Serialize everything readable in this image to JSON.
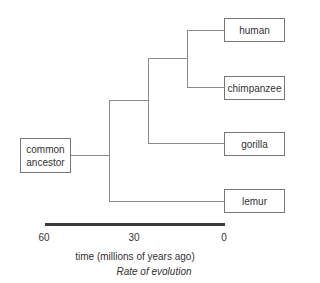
{
  "diagram": {
    "type": "phylogenetic-tree",
    "root": {
      "label_line1": "common",
      "label_line2": "ancestor"
    },
    "leaves": [
      {
        "label": "human"
      },
      {
        "label": "chimpanzee"
      },
      {
        "label": "gorilla"
      },
      {
        "label": "lemur"
      }
    ],
    "tree_structure": "((((human,chimpanzee),gorilla),lemur))common ancestor",
    "axis": {
      "ticks": [
        "60",
        "30",
        "0"
      ],
      "title": "time (millions of years ago)"
    },
    "caption": "Rate of evolution"
  },
  "colors": {
    "branch": "#8a8a8a",
    "box_border": "#777777",
    "axis_bar": "#3a3a3a",
    "text": "#333333"
  }
}
